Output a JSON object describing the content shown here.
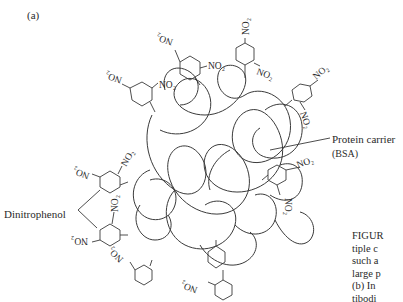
{
  "figure": {
    "panel_label": "(a)",
    "labels": {
      "protein_carrier": "Protein carrier",
      "bsa": "(BSA)",
      "dinitrophenol": "Dinitrophenol"
    },
    "group_label": "NO₂",
    "caption_fragments": [
      "FIGUR",
      "tiple c",
      "such a",
      "large p",
      "(b) In",
      "tibodi"
    ],
    "colors": {
      "line": "#3a3a3a",
      "text": "#2a2a2a",
      "background": "#ffffff"
    }
  }
}
